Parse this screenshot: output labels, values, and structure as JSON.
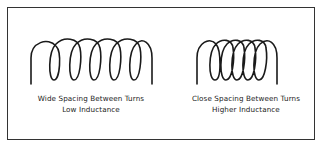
{
  "diagram": {
    "border_color": "#333333",
    "stroke_color": "#1a1a1a",
    "panels": [
      {
        "id": "wide",
        "icon": "coil-wide-spacing-icon",
        "turns": 5,
        "caption_line1": "Wide Spacing Between Turns",
        "caption_line2": "Low Inductance"
      },
      {
        "id": "close",
        "icon": "coil-close-spacing-icon",
        "turns": 5,
        "caption_line1": "Close Spacing Between Turns",
        "caption_line2": "Higher Inductance"
      }
    ]
  }
}
